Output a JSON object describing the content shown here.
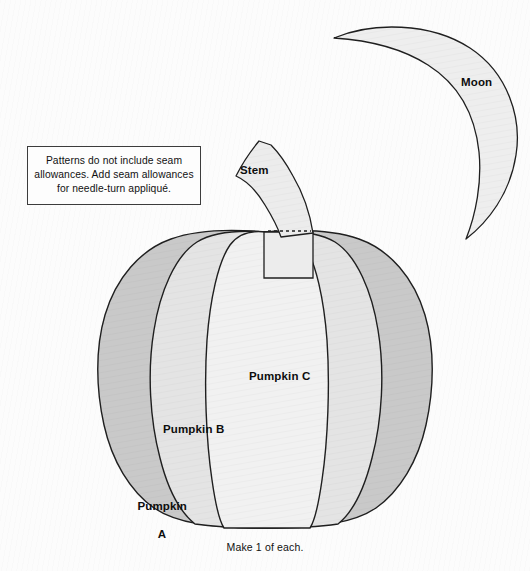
{
  "document": {
    "title": "Pumpkin and Moon Appliqué Pattern",
    "background_color": "#fcfcfc"
  },
  "note": {
    "line1": "Patterns do not include seam",
    "line2": "allowances. Add seam allowances",
    "line3": "for needle-turn appliqué.",
    "text": "Patterns do not include seam allowances. Add seam allowances for needle-turn appliqué.",
    "border_color": "#3c3c3c"
  },
  "caption": {
    "text": "Make 1 of each."
  },
  "shapes": {
    "moon": {
      "label": "Moon",
      "fill": "#eeeeee",
      "stroke": "#1f1f1f"
    },
    "stem": {
      "label": "Stem",
      "fill": "#ececec",
      "stroke": "#1f1f1f",
      "seam_line_style": "dashed"
    },
    "pumpkin_a": {
      "label_line1": "Pumpkin",
      "label_line2": "A",
      "label": "Pumpkin A",
      "fill": "#c9c9c9",
      "stroke": "#1f1f1f"
    },
    "pumpkin_b": {
      "label": "Pumpkin B",
      "fill": "#e4e4e4",
      "stroke": "#1f1f1f"
    },
    "pumpkin_c": {
      "label": "Pumpkin C",
      "fill": "#f1f1f1",
      "stroke": "#1f1f1f"
    }
  },
  "colors": {
    "outline": "#1f1f1f",
    "dark_gray": "#c9c9c9",
    "mid_gray": "#e4e4e4",
    "light_gray": "#f1f1f1",
    "text": "#111111"
  }
}
